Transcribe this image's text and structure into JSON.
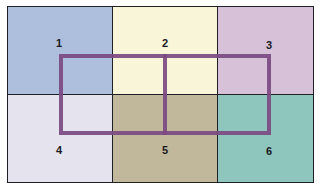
{
  "diagram": {
    "cells": [
      {
        "id": 1,
        "label": "1",
        "color": "#aebfdd"
      },
      {
        "id": 2,
        "label": "2",
        "color": "#f8f5d8"
      },
      {
        "id": 3,
        "label": "3",
        "color": "#d6c1d8"
      },
      {
        "id": 4,
        "label": "4",
        "color": "#e4e3ee"
      },
      {
        "id": 5,
        "label": "5",
        "color": "#c1b79a"
      },
      {
        "id": 6,
        "label": "6",
        "color": "#8ec6be"
      }
    ],
    "overlay": {
      "color": "#7b4a82",
      "description": "Rectangle spanning cells 1-6 with a vertical divider through cells 2 and 5"
    }
  }
}
